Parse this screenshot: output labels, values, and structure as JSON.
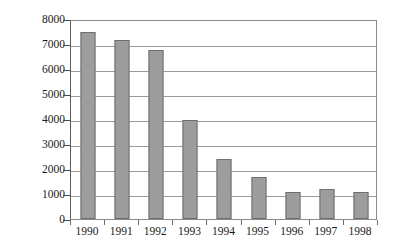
{
  "chart_data": {
    "type": "bar",
    "title": "",
    "subtitle": "",
    "xlabel": "",
    "ylabel": "Total Number",
    "categories": [
      "1990",
      "1991",
      "1992",
      "1993",
      "1994",
      "1995",
      "1996",
      "1997",
      "1998"
    ],
    "values": [
      7500,
      7150,
      6750,
      3980,
      2420,
      1700,
      1080,
      1220,
      1080
    ],
    "series": [
      {
        "name": "Total Number",
        "values": [
          7500,
          7150,
          6750,
          3980,
          2420,
          1700,
          1080,
          1220,
          1080
        ]
      }
    ],
    "ylim": [
      0,
      8000
    ],
    "ytick_labels": [
      "0",
      "1000",
      "2000",
      "3000",
      "4000",
      "5000",
      "6000",
      "7000",
      "8000"
    ],
    "ytick_values": [
      0,
      1000,
      2000,
      3000,
      4000,
      5000,
      6000,
      7000,
      8000
    ],
    "grid": true,
    "grid_axis": "y",
    "legend": false,
    "legend_position": "none",
    "bar_color": "#9d9d9d",
    "bar_edge_color": "#6f6f6f",
    "grid_color": "#9a9a9a",
    "axis_color": "#5a5a5a",
    "background_color": "#ffffff",
    "text_color": "#1a1a1a"
  }
}
